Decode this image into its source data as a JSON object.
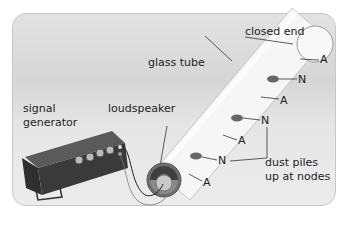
{
  "diagram": {
    "title_labels": {
      "closed_end": "closed end",
      "glass_tube": "glass tube",
      "signal_generator_line1": "signal",
      "signal_generator_line2": "generator",
      "loudspeaker": "loudspeaker",
      "dust_line1": "dust piles",
      "dust_line2": "up at nodes"
    },
    "markers": {
      "antinode": "A",
      "node": "N"
    },
    "colors": {
      "background": "#e0e0e0",
      "tube": "#f4f4f4",
      "dust": "#666666",
      "generator": "#3a3a3a"
    }
  }
}
